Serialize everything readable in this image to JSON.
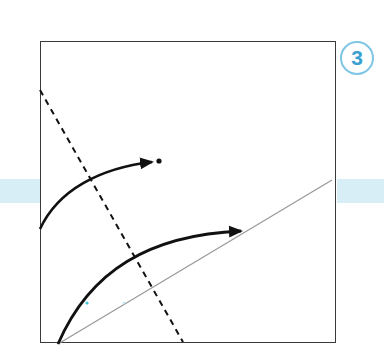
{
  "diagram": {
    "step_number": "3",
    "colors": {
      "band": "#d7eef6",
      "frame": "#3a3a3a",
      "badge_border": "#7fc6e6",
      "badge_text": "#3aa0cf",
      "arrows": "#111111",
      "reference_line": "#9a9a9a"
    },
    "elements": [
      {
        "type": "square-frame",
        "x": 40,
        "y": 41,
        "width": 296,
        "height": 302
      },
      {
        "type": "dashed-fold-line",
        "from": [
          40,
          90
        ],
        "to": [
          183,
          342
        ]
      },
      {
        "type": "thin-reference-line",
        "from": [
          58,
          344
        ],
        "to": [
          332,
          180
        ]
      },
      {
        "type": "curved-arrow",
        "from": [
          40,
          229
        ],
        "to": [
          154,
          162
        ],
        "end_marker": "dot"
      },
      {
        "type": "curved-arrow",
        "from": [
          58,
          344
        ],
        "to": [
          243,
          231
        ]
      }
    ]
  }
}
